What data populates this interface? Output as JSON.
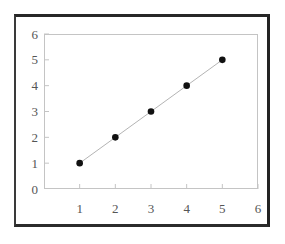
{
  "chart_data": {
    "type": "line",
    "title": "",
    "subtitle": "",
    "xlabel": "",
    "ylabel": "",
    "x": [
      1,
      2,
      3,
      4,
      5
    ],
    "values": [
      1,
      2,
      3,
      4,
      5
    ],
    "series": [
      {
        "name": "",
        "x": [
          1,
          2,
          3,
          4,
          5
        ],
        "values": [
          1,
          2,
          3,
          4,
          5
        ]
      }
    ],
    "xlim": [
      0,
      6
    ],
    "ylim": [
      0,
      6
    ],
    "xticks": [
      1,
      2,
      3,
      4,
      5,
      6
    ],
    "yticks": [
      0,
      1,
      2,
      3,
      4,
      5,
      6
    ],
    "xtick_labels": [
      "1",
      "2",
      "3",
      "4",
      "5",
      "6"
    ],
    "ytick_labels": [
      "0",
      "1",
      "2",
      "3",
      "4",
      "5",
      "6"
    ],
    "grid": false,
    "legend": false,
    "legend_position": "none",
    "marker": "filled-circle",
    "marker_color": "#111111",
    "line_color": "#b4b4b4",
    "plot_border_color": "#c4c4c4",
    "frame_color": "#272727",
    "background_color": "#ffffff",
    "tick_label_color": "#555555",
    "annotations": []
  }
}
